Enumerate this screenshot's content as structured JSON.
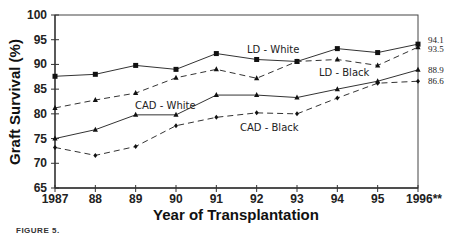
{
  "chart_data": {
    "type": "line",
    "title": "",
    "xlabel": "Year of Transplantation",
    "ylabel": "Graft Survival (%)",
    "ylim": [
      65,
      100
    ],
    "yticks": [
      65,
      70,
      75,
      80,
      85,
      90,
      95,
      100
    ],
    "categories": [
      "1987",
      "88",
      "89",
      "90",
      "91",
      "92",
      "93",
      "94",
      "95",
      "1996**"
    ],
    "grid": false,
    "legend": "inline labels",
    "series": [
      {
        "name": "LD - White",
        "style": "solid",
        "marker": "square",
        "values": [
          87.6,
          88.0,
          89.8,
          89.0,
          92.2,
          91.0,
          90.6,
          93.2,
          92.4,
          94.1
        ],
        "end_label": "94.1"
      },
      {
        "name": "LD - Black",
        "style": "dashed",
        "marker": "triangle",
        "values": [
          81.2,
          82.8,
          84.2,
          87.3,
          89.0,
          87.2,
          90.6,
          91.0,
          89.8,
          93.5
        ],
        "end_label": "93.5"
      },
      {
        "name": "CAD - White",
        "style": "solid",
        "marker": "triangle",
        "values": [
          75.0,
          76.8,
          79.8,
          79.8,
          83.8,
          83.8,
          83.3,
          85.0,
          86.6,
          88.9
        ],
        "end_label": "88.9"
      },
      {
        "name": "CAD - Black",
        "style": "dashed",
        "marker": "diamond",
        "values": [
          73.2,
          71.6,
          73.4,
          77.6,
          79.3,
          80.2,
          80.0,
          83.2,
          86.2,
          86.6
        ],
        "end_label": "86.6"
      }
    ]
  },
  "caption": "FIGURE 5."
}
